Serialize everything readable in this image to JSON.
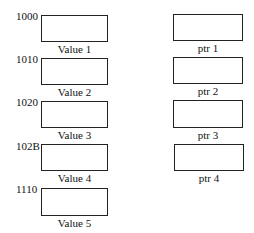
{
  "values": [
    {
      "address": "1000",
      "label": "Value 1"
    },
    {
      "address": "1010",
      "label": "Value 2"
    },
    {
      "address": "1020",
      "label": "Value 3"
    },
    {
      "address": "102B",
      "label": "Value 4"
    },
    {
      "address": "1110",
      "label": "Value 5"
    }
  ],
  "pointers": [
    {
      "label": "ptr 1"
    },
    {
      "label": "ptr 2"
    },
    {
      "label": "ptr 3"
    },
    {
      "label": "ptr 4"
    }
  ]
}
